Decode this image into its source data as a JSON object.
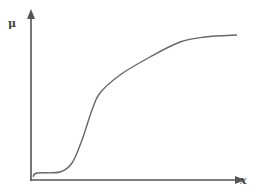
{
  "chart_data": {
    "type": "line",
    "title": "",
    "xlabel": "x",
    "ylabel": "μ",
    "grid": false,
    "legend": null,
    "ticks": {
      "x": [],
      "y": []
    },
    "series": [
      {
        "name": "μ(x)",
        "x": [
          0.01,
          0.03,
          0.14,
          0.2,
          0.25,
          0.3,
          0.33,
          0.43,
          0.57,
          0.72,
          0.84,
          1.0
        ],
        "y": [
          0.02,
          0.04,
          0.05,
          0.1,
          0.24,
          0.42,
          0.52,
          0.63,
          0.74,
          0.83,
          0.86,
          0.87
        ]
      }
    ],
    "pixel_path": [
      [
        33,
        177
      ],
      [
        37,
        173
      ],
      [
        60,
        172
      ],
      [
        72,
        163
      ],
      [
        82,
        140
      ],
      [
        92,
        110
      ],
      [
        100,
        93
      ],
      [
        120,
        75
      ],
      [
        150,
        57
      ],
      [
        180,
        42
      ],
      [
        205,
        37
      ],
      [
        237,
        35
      ]
    ],
    "colors": {
      "axis": "#555555",
      "curve": "#666666",
      "background": "#ffffff"
    }
  },
  "labels": {
    "y_axis": "μ",
    "x_axis": "x"
  }
}
